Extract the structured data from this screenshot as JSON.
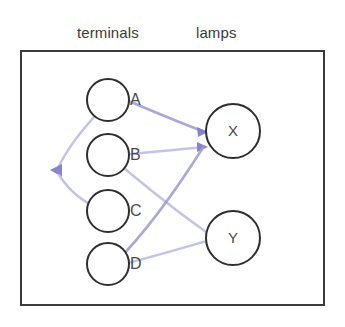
{
  "header": {
    "terminals_label": "terminals",
    "lamps_label": "lamps"
  },
  "frame": {
    "border_color": "#3b3b3b",
    "background_color": "#ffffff"
  },
  "colors": {
    "wire": "#9a9ad2",
    "wire_light": "#bdbde6",
    "arrow": "#8080c8",
    "node_stroke": "#2e2e2e",
    "text": "#3a3a3a"
  },
  "terminals": [
    {
      "id": "A",
      "label": "A",
      "cx": 108,
      "cy": 100,
      "r": 21
    },
    {
      "id": "B",
      "label": "B",
      "cx": 108,
      "cy": 155,
      "r": 21
    },
    {
      "id": "C",
      "label": "C",
      "cx": 108,
      "cy": 211,
      "r": 21
    },
    {
      "id": "D",
      "label": "D",
      "cx": 108,
      "cy": 264,
      "r": 21
    }
  ],
  "lamps": [
    {
      "id": "X",
      "label": "X",
      "cx": 233,
      "cy": 131,
      "r": 27
    },
    {
      "id": "Y",
      "label": "Y",
      "cx": 233,
      "cy": 238,
      "r": 27
    }
  ],
  "connections": [
    {
      "from": "A",
      "to": "X",
      "style": "solid"
    },
    {
      "from": "A",
      "to": "junction",
      "style": "light"
    },
    {
      "from": "junction",
      "to": "C",
      "style": "light"
    },
    {
      "from": "B",
      "to": "X",
      "style": "light"
    },
    {
      "from": "B",
      "to": "Y",
      "style": "light"
    },
    {
      "from": "D",
      "to": "X",
      "style": "solid"
    },
    {
      "from": "Y",
      "to": "D",
      "style": "light"
    }
  ],
  "junction": {
    "x": 56,
    "y": 171
  }
}
